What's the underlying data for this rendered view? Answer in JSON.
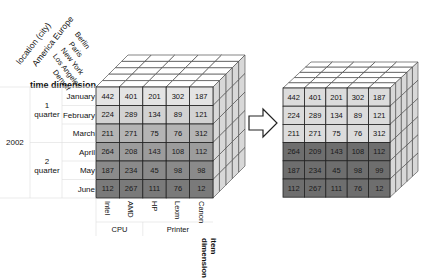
{
  "left_cube": {
    "axis_labels": {
      "location": "location (city)",
      "location_groups": "America Europe",
      "time": "time dimension",
      "item": "item dimension"
    },
    "cities": [
      "Berlin",
      "Paris",
      "New York",
      "Los Angeles",
      "Denver"
    ],
    "time": {
      "year": "2002",
      "quarters": [
        {
          "label_num": "1",
          "label_text": "quarter",
          "months": [
            "January",
            "February",
            "March"
          ]
        },
        {
          "label_num": "2",
          "label_text": "quarter",
          "months": [
            "April",
            "May",
            "June"
          ]
        }
      ]
    },
    "items": [
      "Intel",
      "AMD",
      "HP",
      "Lexm",
      "Canon"
    ],
    "item_groups": [
      {
        "label": "CPU",
        "span": 2
      },
      {
        "label": "Printer",
        "span": 3
      }
    ],
    "values": [
      [
        442,
        401,
        201,
        302,
        187
      ],
      [
        224,
        289,
        134,
        89,
        121
      ],
      [
        211,
        271,
        75,
        76,
        312
      ],
      [
        264,
        208,
        143,
        108,
        112
      ],
      [
        187,
        234,
        45,
        98,
        98
      ],
      [
        112,
        267,
        111,
        76,
        12
      ]
    ],
    "row_colors": [
      "#e4e4e4",
      "#d2d2d2",
      "#b4b4b4",
      "#9c9c9c",
      "#8a8a8a",
      "#7a7a7a"
    ]
  },
  "arrow": {
    "direction": "right"
  },
  "right_cube": {
    "values": [
      [
        442,
        401,
        201,
        302,
        187
      ],
      [
        224,
        289,
        134,
        89,
        121
      ],
      [
        211,
        271,
        75,
        76,
        312
      ],
      [
        264,
        209,
        143,
        108,
        112
      ],
      [
        187,
        234,
        45,
        98,
        99
      ],
      [
        112,
        267,
        111,
        76,
        12
      ]
    ],
    "row_colors": [
      "#dcdcdc",
      "#dcdcdc",
      "#dcdcdc",
      "#6e6e6e",
      "#6e6e6e",
      "#6e6e6e"
    ]
  }
}
